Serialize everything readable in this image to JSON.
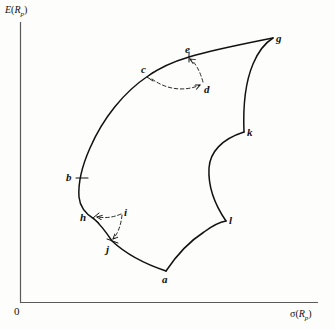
{
  "figure": {
    "type": "diagram",
    "background_color": "#fdfdfb",
    "ink_color": "#111111"
  },
  "axes": {
    "y_axis": {
      "label_prefix": "E(",
      "label_var": "R",
      "label_sub": "p",
      "label_suffix": ")",
      "label_text": "E(Rp)"
    },
    "x_axis": {
      "label_prefix": "σ(",
      "label_var": "R",
      "label_sub": "p",
      "label_suffix": ")",
      "label_text": "σ(Rp)"
    },
    "origin_label": "0"
  },
  "points": [
    {
      "id": "a",
      "label": "a",
      "x": 166,
      "y": 271,
      "label_x": 162,
      "label_y": 274,
      "marker": "none",
      "on_curve": true
    },
    {
      "id": "b",
      "label": "b",
      "x": 79,
      "y": 178,
      "label_x": 66,
      "label_y": 172,
      "marker": "tick",
      "on_curve": true
    },
    {
      "id": "c",
      "label": "c",
      "x": 148,
      "y": 76,
      "label_x": 141,
      "label_y": 64,
      "marker": "arrow",
      "on_curve": true
    },
    {
      "id": "d",
      "label": "d",
      "x": 203,
      "y": 85,
      "label_x": 204,
      "label_y": 84,
      "marker": "arrow",
      "on_curve": false
    },
    {
      "id": "e",
      "label": "e",
      "x": 189,
      "y": 57,
      "label_x": 185,
      "label_y": 44,
      "marker": "arrow",
      "on_curve": true
    },
    {
      "id": "g",
      "label": "g",
      "x": 273,
      "y": 38,
      "label_x": 276,
      "label_y": 33,
      "marker": "none",
      "on_curve": true
    },
    {
      "id": "h",
      "label": "h",
      "x": 94,
      "y": 218,
      "label_x": 80,
      "label_y": 214,
      "marker": "arrow",
      "on_curve": true
    },
    {
      "id": "i",
      "label": "i",
      "x": 122,
      "y": 214,
      "label_x": 124,
      "label_y": 209,
      "marker": "none",
      "on_curve": false
    },
    {
      "id": "j",
      "label": "j",
      "x": 112,
      "y": 241,
      "label_x": 106,
      "label_y": 243,
      "marker": "arrow",
      "on_curve": true
    },
    {
      "id": "k",
      "label": "k",
      "x": 244,
      "y": 132,
      "label_x": 247,
      "label_y": 128,
      "marker": "none",
      "on_curve": true
    },
    {
      "id": "l",
      "label": "l",
      "x": 226,
      "y": 221,
      "label_x": 229,
      "label_y": 216,
      "marker": "none",
      "on_curve": true
    }
  ],
  "curves": [
    {
      "id": "left-frontier",
      "from": "g",
      "through": "e,c,b,h,j",
      "to": "a",
      "style": "solid"
    },
    {
      "id": "lower-right-arc",
      "from": "a",
      "to": "l",
      "style": "solid"
    },
    {
      "id": "notch-arc",
      "from": "l",
      "to": "k",
      "style": "solid"
    },
    {
      "id": "upper-right-arc",
      "from": "k",
      "to": "g",
      "style": "solid"
    }
  ],
  "construction_lines": [
    {
      "id": "c-to-d",
      "from": "c",
      "to": "d",
      "style": "dashed",
      "arrow_at": "both"
    },
    {
      "id": "d-to-e",
      "from": "d",
      "to": "e",
      "style": "dashed",
      "arrow_at": "e"
    },
    {
      "id": "h-to-i",
      "from": "h",
      "to": "i",
      "style": "dashed",
      "arrow_at": "h"
    },
    {
      "id": "i-to-j",
      "from": "i",
      "to": "j",
      "style": "dashed",
      "arrow_at": "j"
    }
  ]
}
